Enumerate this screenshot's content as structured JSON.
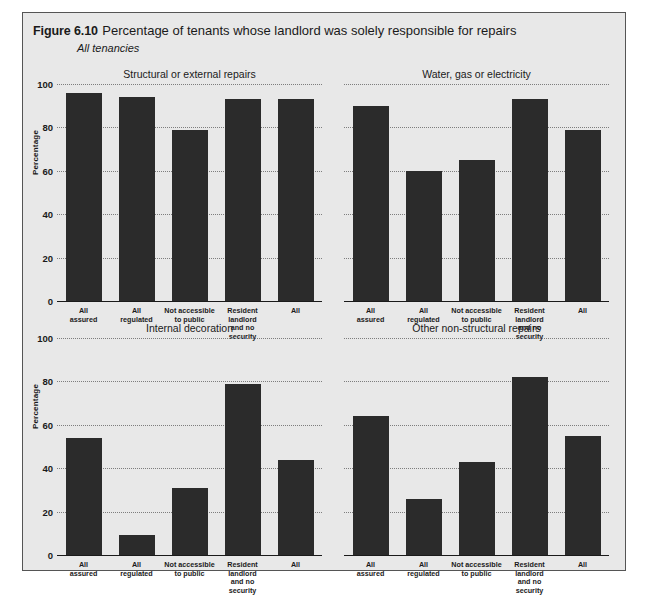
{
  "figure": {
    "number": "Figure 6.10",
    "title": "Percentage of tenants whose landlord was solely responsible for repairs",
    "subtitle": "All tenancies"
  },
  "axis": {
    "ylabel": "Percentage",
    "ticks": [
      "100",
      "80",
      "60",
      "40",
      "20",
      "0"
    ]
  },
  "chart_data": {
    "type": "bar",
    "title": "Percentage of tenants whose landlord was solely responsible for repairs",
    "subtitle": "All tenancies",
    "xlabel": "",
    "ylabel": "Percentage",
    "ylim": [
      0,
      100
    ],
    "yticks": [
      0,
      20,
      40,
      60,
      80,
      100
    ],
    "grid": true,
    "legend": "none",
    "categories": [
      "All assured",
      "All regulated",
      "Not accessible to public",
      "Resident landlord and no security",
      "All"
    ],
    "panels": [
      {
        "title": "Structural or external repairs",
        "position": "top-left",
        "values": [
          96,
          94,
          79,
          93,
          93
        ]
      },
      {
        "title": "Water, gas or electricity",
        "position": "top-right",
        "values": [
          90,
          60,
          65,
          93,
          79
        ]
      },
      {
        "title": "Internal decoration",
        "position": "bottom-left",
        "values": [
          54,
          9,
          31,
          79,
          44
        ]
      },
      {
        "title": "Other non-structural repairs",
        "position": "bottom-right",
        "values": [
          64,
          26,
          43,
          82,
          55
        ]
      }
    ]
  },
  "style": {
    "bar_color": "#2b2b2b",
    "panel_background": "#e8e8e8",
    "gridline_color": "#7d7d7d",
    "axis_color": "#1a1a1a",
    "frame_border": "#555555"
  }
}
